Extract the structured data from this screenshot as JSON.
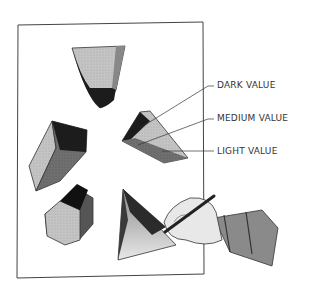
{
  "illustration": {
    "subject": "Hand shading geometric solids on a sheet of paper",
    "labels": {
      "dark": "DARK VALUE",
      "medium": "MEDIUM VALUE",
      "light": "LIGHT VALUE"
    },
    "colors": {
      "paper": "#ffffff",
      "outline": "#333333",
      "dark": "#1c1c1c",
      "medium": "#6e6e6e",
      "light": "#bdbdbd"
    }
  }
}
